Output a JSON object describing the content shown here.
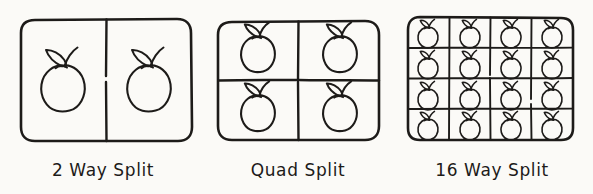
{
  "diagram": {
    "style": "hand-drawn sketch",
    "ink_color": "#1d1b19",
    "paper_color": "#fbfaf7",
    "panel_count": 3
  },
  "panels": [
    {
      "id": "two-way",
      "caption": "2 Way Split",
      "rows": 1,
      "columns": 2,
      "cell_count": 2,
      "icon": "apple-icon",
      "icon_size": "large"
    },
    {
      "id": "quad",
      "caption": "Quad Split",
      "rows": 2,
      "columns": 2,
      "cell_count": 4,
      "icon": "apple-icon",
      "icon_size": "medium"
    },
    {
      "id": "sixteen-way",
      "caption": "16 Way Split",
      "rows": 4,
      "columns": 4,
      "cell_count": 16,
      "icon": "apple-icon",
      "icon_size": "small"
    }
  ]
}
